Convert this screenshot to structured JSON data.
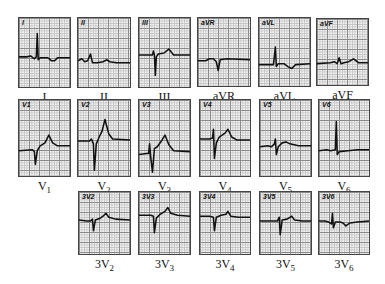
{
  "figure": {
    "rows": [
      {
        "leads": [
          {
            "id": "I",
            "tag": "I",
            "caption": "I",
            "sub": "",
            "x": 18,
            "y": 17,
            "w": 53,
            "h": 71,
            "trace": "M0,40 L8,40 L12,39 L16,42 L18,40 L19,16 L20,43 L22,41 L30,41 L34,44 L37,44 L40,41 L53,41"
          },
          {
            "id": "II",
            "tag": "II",
            "caption": "II",
            "sub": "",
            "x": 77,
            "y": 17,
            "w": 54,
            "h": 71,
            "trace": "M0,44 L4,42 L7,45 L10,44 L13,37 L15,46 L20,46 L26,45 L30,43 L33,45 L40,46 L54,46"
          },
          {
            "id": "III",
            "tag": "III",
            "caption": "III",
            "sub": "",
            "x": 138,
            "y": 17,
            "w": 53,
            "h": 71,
            "trace": "M0,38 L14,38 L15,34 L16,38 L17,59 L18,40 L20,37 L26,36 L31,32 L36,38 L53,38"
          },
          {
            "id": "aVR",
            "tag": "aVR",
            "caption": "aVR",
            "sub": "",
            "x": 197,
            "y": 17,
            "w": 54,
            "h": 70,
            "trace": "M0,44 L8,44 L12,42 L16,42 L19,45 L21,54 L23,43 L30,42 L54,43"
          },
          {
            "id": "aVL",
            "tag": "aVL",
            "caption": "aVL",
            "sub": "",
            "x": 258,
            "y": 17,
            "w": 53,
            "h": 70,
            "trace": "M0,48 L10,48 L15,48 L17,30 L18,50 L20,47 L26,47 L30,50 L34,52 L38,48 L53,47"
          },
          {
            "id": "aVF",
            "tag": "aVF",
            "caption": "aVF",
            "sub": "",
            "x": 316,
            "y": 18,
            "w": 53,
            "h": 68,
            "trace": "M0,46 L14,45 L18,44 L21,46 L23,40 L25,46 L28,45 L33,44 L38,41 L43,45 L53,45"
          }
        ]
      },
      {
        "leads": [
          {
            "id": "V1",
            "tag": "V1",
            "caption": "V",
            "sub": "1",
            "x": 18,
            "y": 99,
            "w": 53,
            "h": 78,
            "trace": "M0,52 L14,51 L16,53 L17,66 L19,52 L22,47 L27,44 L31,36 L35,44 L40,47 L53,47"
          },
          {
            "id": "V2",
            "tag": "V2",
            "caption": "V",
            "sub": "2",
            "x": 77,
            "y": 99,
            "w": 54,
            "h": 78,
            "trace": "M0,42 L12,42 L14,40 L16,45 L17,72 L19,45 L22,38 L25,32 L28,20 L32,35 L36,40 L54,41"
          },
          {
            "id": "V3",
            "tag": "V3",
            "caption": "V",
            "sub": "3",
            "x": 138,
            "y": 99,
            "w": 53,
            "h": 78,
            "trace": "M0,56 L8,55 L10,55 L11,45 L12,57 L14,74 L16,50 L19,48 L24,41 L27,36 L31,46 L36,52 L53,53"
          },
          {
            "id": "V4",
            "tag": "V4",
            "caption": "V",
            "sub": "4",
            "x": 199,
            "y": 99,
            "w": 52,
            "h": 78,
            "trace": "M0,40 L10,40 L13,39 L14,30 L15,60 L17,44 L20,38 L26,34 L29,30 L33,38 L38,41 L52,41"
          },
          {
            "id": "V5",
            "tag": "V5",
            "caption": "V",
            "sub": "5",
            "x": 259,
            "y": 99,
            "w": 53,
            "h": 78,
            "trace": "M0,48 L8,47 L12,48 L15,45 L16,40 L17,56 L19,48 L23,44 L27,43 L31,45 L40,47 L53,47"
          },
          {
            "id": "V6",
            "tag": "V6",
            "caption": "V",
            "sub": "6",
            "x": 318,
            "y": 99,
            "w": 52,
            "h": 78,
            "trace": "M0,52 L8,51 L12,52 L17,51 L18,22 L19,56 L21,53 L30,52 L40,51 L52,51"
          }
        ]
      },
      {
        "leads": [
          {
            "id": "3V2",
            "tag": "3V2",
            "caption": "3V",
            "sub": "2",
            "x": 78,
            "y": 191,
            "w": 53,
            "h": 64,
            "trace": "M0,29 L8,30 L12,30 L14,28 L15,40 L17,29 L22,27 L25,25 L28,22 L31,26 L38,28 L53,29"
          },
          {
            "id": "3V3",
            "tag": "3V3",
            "caption": "3V",
            "sub": "3",
            "x": 138,
            "y": 191,
            "w": 53,
            "h": 64,
            "trace": "M0,24 L12,24 L15,25 L16,42 L18,27 L22,23 L27,20 L30,16 L33,22 L40,24 L53,25"
          },
          {
            "id": "3V4",
            "tag": "3V4",
            "caption": "3V",
            "sub": "4",
            "x": 199,
            "y": 191,
            "w": 52,
            "h": 64,
            "trace": "M0,25 L10,25 L14,26 L15,40 L17,26 L22,24 L27,23 L29,20 L32,25 L40,26 L52,26"
          },
          {
            "id": "3V5",
            "tag": "3V5",
            "caption": "3V",
            "sub": "5",
            "x": 259,
            "y": 191,
            "w": 53,
            "h": 64,
            "trace": "M0,30 L12,30 L18,30 L20,26 L21,44 L23,29 L28,28 L33,25 L36,29 L44,30 L53,30"
          },
          {
            "id": "3V6",
            "tag": "3V6",
            "caption": "3V",
            "sub": "6",
            "x": 318,
            "y": 191,
            "w": 52,
            "h": 64,
            "trace": "M0,30 L6,30 L10,31 L13,33 L14,22 L15,37 L17,31 L22,31 L25,32 L28,35 L32,32 L40,31 L52,30"
          }
        ]
      }
    ],
    "colors": {
      "trace": "#111111",
      "grid_major": "#8a8a8a",
      "grid_minor": "#c4c4c4",
      "paper": "#f4f4f4",
      "border": "#444444"
    }
  }
}
